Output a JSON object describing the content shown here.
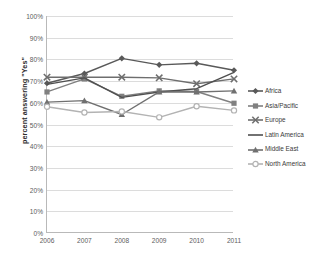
{
  "chart_data": {
    "type": "line",
    "title": "",
    "xlabel": "",
    "ylabel": "percent answering \"Yes\"",
    "categories": [
      "2006",
      "2007",
      "2008",
      "2009",
      "2010",
      "2011"
    ],
    "x": [
      2006,
      2007,
      2008,
      2009,
      2010,
      2011
    ],
    "ylim": [
      0,
      100
    ],
    "ytick_labels": [
      "0%",
      "10%",
      "20%",
      "30%",
      "40%",
      "50%",
      "60%",
      "70%",
      "80%",
      "90%",
      "100%"
    ],
    "ytick_values": [
      0,
      10,
      20,
      30,
      40,
      50,
      60,
      70,
      80,
      90,
      100
    ],
    "grid": true,
    "legend_position": "right",
    "series": [
      {
        "name": "Africa",
        "color": "#595959",
        "marker": "diamond",
        "values": [
          69,
          73.5,
          80.5,
          77.5,
          78.2,
          75
        ]
      },
      {
        "name": "Asia/Pacific",
        "color": "#808080",
        "marker": "square",
        "values": [
          65,
          71,
          63,
          65.5,
          65.2,
          59.8
        ]
      },
      {
        "name": "Europe",
        "color": "#6e6e6e",
        "marker": "x",
        "values": [
          71.8,
          71.8,
          71.8,
          71.5,
          68.8,
          71
        ]
      },
      {
        "name": "Latin America",
        "color": "#4f4f4f",
        "marker": "none",
        "values": [
          68.5,
          71.5,
          62.5,
          65,
          66.5,
          74
        ]
      },
      {
        "name": "Middle East",
        "color": "#707070",
        "marker": "triangle",
        "values": [
          60.3,
          61,
          54.6,
          65,
          65,
          65.5
        ]
      },
      {
        "name": "North America",
        "color": "#b3b3b3",
        "marker": "circle-open",
        "values": [
          58.2,
          55.5,
          56,
          53.3,
          58.4,
          56.5
        ]
      }
    ]
  },
  "legend": {
    "items": [
      {
        "label": "Africa"
      },
      {
        "label": "Asia/Pacific"
      },
      {
        "label": "Europe"
      },
      {
        "label": "Latin America"
      },
      {
        "label": "Middle East"
      },
      {
        "label": "North America"
      }
    ]
  }
}
